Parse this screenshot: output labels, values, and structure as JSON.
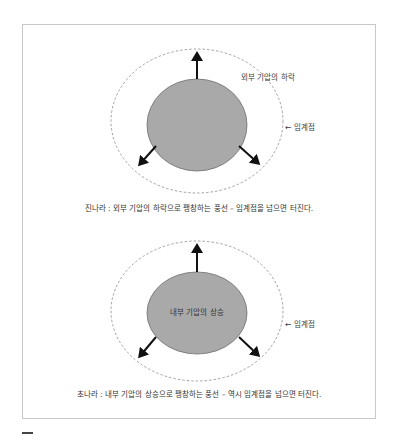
{
  "colors": {
    "balloon_fill": "#a9a9a9",
    "balloon_stroke": "#6e6e6e",
    "arrow": "#111111",
    "threshold_dash": "#8a8a8a",
    "frame_border": "#c8c8c8"
  },
  "diagrams": [
    {
      "outer_label": "외부 기압의 하락",
      "threshold_label": "← 임계점",
      "inner_label": "",
      "caption": "진나라 : 외부 기압의 하락으로 팽창하는 풍선 – 임계점을 넘으면 터진다."
    },
    {
      "outer_label": "",
      "threshold_label": "← 임계점",
      "inner_label": "내부 기압의 상승",
      "caption": "초나라 : 내부 기압의 상승으로 팽창하는 풍선 – 역시 임계점을 넘으면 터진다."
    }
  ]
}
